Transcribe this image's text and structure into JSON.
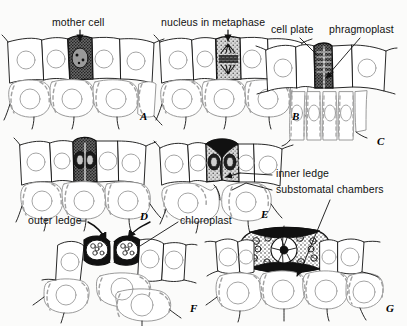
{
  "figure": {
    "background_color": "#fbfbfa",
    "ink_color": "#111111",
    "shading_color": "#333333",
    "panel_count": 7
  },
  "labels": {
    "mother_cell": "mother cell",
    "nucleus_metaphase": "nucleus in metaphase",
    "cell_plate": "cell plate",
    "phragmoplast": "phragmoplast",
    "inner_ledge": "inner ledge",
    "substomatal_chambers": "substomatal chambers",
    "outer_ledge": "outer ledge",
    "chloroplast": "chloroplast"
  },
  "panels": [
    {
      "letter": "A",
      "caption": "mother cell"
    },
    {
      "letter": "B",
      "caption": "nucleus in metaphase"
    },
    {
      "letter": "C",
      "caption": "cell plate / phragmoplast"
    },
    {
      "letter": "D",
      "caption": "two daughter nuclei"
    },
    {
      "letter": "E",
      "caption": "inner ledge, substomatal chambers"
    },
    {
      "letter": "F",
      "caption": "outer ledge, chloroplast"
    },
    {
      "letter": "G",
      "caption": "surface view of stoma"
    }
  ]
}
